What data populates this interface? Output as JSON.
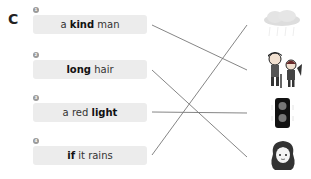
{
  "section": {
    "letter": "C"
  },
  "items": [
    {
      "number": "1",
      "pre": "a ",
      "bold": "kind",
      "post": " man"
    },
    {
      "number": "2",
      "pre": "",
      "bold": "long",
      "post": " hair"
    },
    {
      "number": "3",
      "pre": "a red ",
      "bold": "light",
      "post": ""
    },
    {
      "number": "4",
      "pre": "",
      "bold": "if",
      "post": " it rains"
    }
  ],
  "pictures": [
    {
      "icon": "rain-cloud-icon"
    },
    {
      "icon": "elderly-man-and-child-icon"
    },
    {
      "icon": "traffic-light-icon"
    },
    {
      "icon": "long-haired-girl-icon"
    }
  ],
  "connections": [
    {
      "from": 1,
      "to": 2
    },
    {
      "from": 2,
      "to": 4
    },
    {
      "from": 3,
      "to": 3
    },
    {
      "from": 4,
      "to": 1
    }
  ],
  "colors": {
    "line": "#777777",
    "box": "#ececec"
  }
}
